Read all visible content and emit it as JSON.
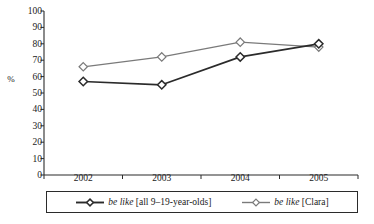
{
  "chart_data": {
    "type": "line",
    "title": "",
    "xlabel": "",
    "ylabel": "%",
    "categories": [
      "2002",
      "2003",
      "2004",
      "2005"
    ],
    "ylim": [
      0,
      100
    ],
    "yticks": [
      0,
      10,
      20,
      30,
      40,
      50,
      60,
      70,
      80,
      90,
      100
    ],
    "ytick_labels": [
      "0",
      "10",
      "20",
      "30",
      "40",
      "50",
      "60",
      "70",
      "80",
      "90",
      "100"
    ],
    "grid": false,
    "legend_position": "bottom",
    "marker": "diamond",
    "series": [
      {
        "name": "be like [all 9–19-year-olds]",
        "name_italic_part": "be like",
        "name_plain_part": " [all 9–19-year-olds]",
        "color": "#2b2b2b",
        "values": [
          57,
          55,
          72,
          80
        ]
      },
      {
        "name": "be like [Clara]",
        "name_italic_part": "be like",
        "name_plain_part": " [Clara]",
        "color": "#7a7a7a",
        "values": [
          66,
          72,
          81,
          78
        ]
      }
    ]
  },
  "axis": {
    "y_title": "%"
  },
  "colors": {
    "axis": "#2b2b2b",
    "series_dark": "#2b2b2b",
    "series_gray": "#7a7a7a",
    "background": "#ffffff",
    "marker_fill": "#ffffff"
  }
}
